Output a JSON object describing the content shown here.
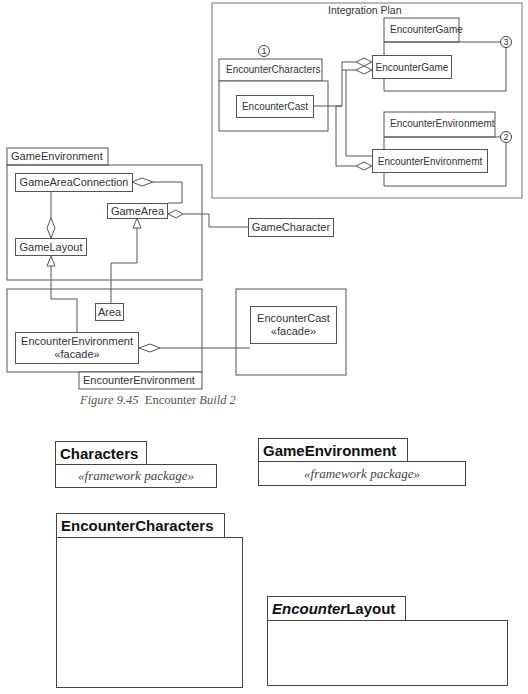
{
  "integration_plan": {
    "title": "Integration Plan",
    "packages": [
      {
        "name": "EncounterCharacters",
        "step": "1",
        "inner_class": "EncounterCast"
      },
      {
        "name": "EncounterGame",
        "step": "3",
        "inner_class": "EncounterGame"
      },
      {
        "name": "EncounterEnvironmemt",
        "step": "2",
        "inner_class": "EncounterEnvironmemt"
      }
    ]
  },
  "game_environment": {
    "package_name": "GameEnvironment",
    "classes": {
      "game_area_connection": "GameAreaConnection",
      "game_area": "GameArea",
      "game_layout": "GameLayout"
    },
    "external_class": "GameCharacter"
  },
  "encounter_environment": {
    "package_name": "EncounterEnvironment",
    "classes": {
      "area": "Area",
      "facade_name": "EncounterEnvironment",
      "facade_stereotype": "«facade»"
    }
  },
  "encounter_cast_package": {
    "class_name": "EncounterCast",
    "stereotype": "«facade»"
  },
  "caption": {
    "figure": "Figure 9.45",
    "text_regular": "Encounter",
    "text_italic": "Build 2"
  },
  "framework_packages": [
    {
      "name": "Characters",
      "stereotype": "«framework package»"
    },
    {
      "name": "GameEnvironment",
      "stereotype": "«framework package»"
    }
  ],
  "packages": [
    {
      "name": "EncounterCharacters"
    },
    {
      "name_italic": "Encounter",
      "name_regular": "Layout"
    }
  ]
}
